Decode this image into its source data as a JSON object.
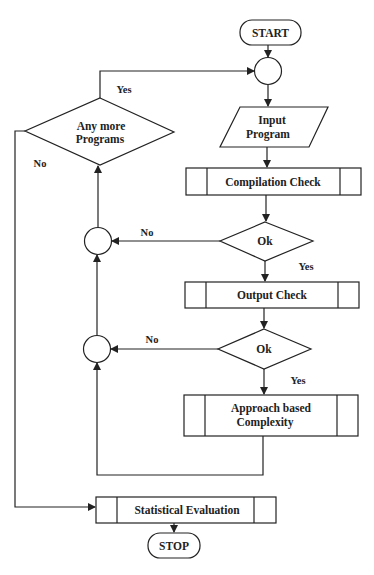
{
  "diagram": {
    "type": "flowchart",
    "nodes": {
      "start": {
        "label": "START",
        "shape": "terminator"
      },
      "merge_top": {
        "label": "",
        "shape": "connector"
      },
      "input": {
        "label_line1": "Input",
        "label_line2": "Program",
        "shape": "parallelogram"
      },
      "compile": {
        "label": "Compilation Check",
        "shape": "predefined-process"
      },
      "ok1": {
        "label": "Ok",
        "shape": "decision"
      },
      "merge_1": {
        "label": "",
        "shape": "connector"
      },
      "output": {
        "label": "Output Check",
        "shape": "predefined-process"
      },
      "ok2": {
        "label": "Ok",
        "shape": "decision"
      },
      "merge_2": {
        "label": "",
        "shape": "connector"
      },
      "approach": {
        "label_line1": "Approach based",
        "label_line2": "Complexity",
        "shape": "predefined-process"
      },
      "more": {
        "label_line1": "Any more",
        "label_line2": "Programs",
        "shape": "decision"
      },
      "stats": {
        "label": "Statistical Evaluation",
        "shape": "predefined-process"
      },
      "stop": {
        "label": "STOP",
        "shape": "terminator"
      }
    },
    "edges": {
      "more_yes": "Yes",
      "more_no": "No",
      "ok1_no": "No",
      "ok1_yes": "Yes",
      "ok2_no": "No",
      "ok2_yes": "Yes"
    },
    "colors": {
      "line": "#222222",
      "fill": "#ffffff",
      "background": "#ffffff"
    }
  }
}
